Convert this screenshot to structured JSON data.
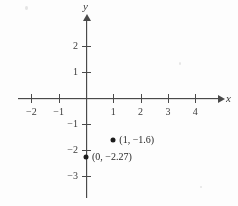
{
  "figure": {
    "kind": "coordinate-plane-scatter",
    "background_color": "#fdfdfc",
    "ink_color": "#3a3a3a"
  },
  "axes": {
    "x_label": "x",
    "y_label": "y",
    "origin_px": {
      "x": 86,
      "y": 98
    },
    "unit_px": {
      "x": 27.3,
      "y": 26
    }
  },
  "chart_data": {
    "type": "scatter",
    "title": "",
    "xlabel": "x",
    "ylabel": "y",
    "xlim": [
      -2.5,
      5.0
    ],
    "ylim": [
      -3.0,
      3.0
    ],
    "grid": false,
    "legend": false,
    "x_ticks": [
      -2,
      -1,
      1,
      2,
      3,
      4
    ],
    "x_tick_labels": [
      "−2",
      "−1",
      "1",
      "2",
      "3",
      "4"
    ],
    "y_ticks": [
      2,
      1,
      -1,
      -2,
      -3
    ],
    "y_tick_labels": [
      "2",
      "1",
      "−1",
      "−2",
      "−3"
    ],
    "points": [
      {
        "x": 1,
        "y": -1.6,
        "label": "(1, −1.6)",
        "label_side": "right"
      },
      {
        "x": 0,
        "y": -2.27,
        "label": "(0, −2.27)",
        "label_side": "right"
      }
    ]
  }
}
